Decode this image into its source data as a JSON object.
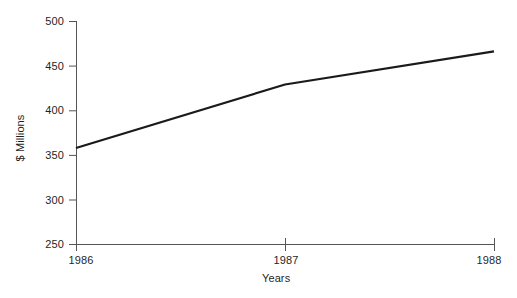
{
  "chart_data": {
    "type": "line",
    "title": "",
    "xlabel": "Years",
    "ylabel": "$ Millions",
    "x": [
      1986,
      1987,
      1988
    ],
    "xticklabels": [
      "1986",
      "1987",
      "1988"
    ],
    "yticks": [
      250,
      300,
      350,
      400,
      450,
      500
    ],
    "yticklabels": [
      "250",
      "300",
      "350",
      "400",
      "450",
      "500"
    ],
    "ylim": [
      250,
      500
    ],
    "xlim": [
      1986,
      1988
    ],
    "grid": false,
    "legend": false,
    "series": [
      {
        "name": "",
        "values": [
          358,
          429,
          466
        ]
      }
    ],
    "line_color": "#1a1a1a",
    "axis_color": "#555555",
    "background_color": "#ffffff"
  },
  "axes": {
    "y": {
      "title": "$ Millions",
      "ticks": [
        {
          "value": 500,
          "label": "500"
        },
        {
          "value": 450,
          "label": "450"
        },
        {
          "value": 400,
          "label": "400"
        },
        {
          "value": 350,
          "label": "350"
        },
        {
          "value": 300,
          "label": "300"
        },
        {
          "value": 250,
          "label": "250"
        }
      ]
    },
    "x": {
      "title": "Years",
      "ticks": [
        {
          "value": 1986,
          "label": "1986"
        },
        {
          "value": 1987,
          "label": "1987"
        },
        {
          "value": 1988,
          "label": "1988"
        }
      ]
    }
  }
}
